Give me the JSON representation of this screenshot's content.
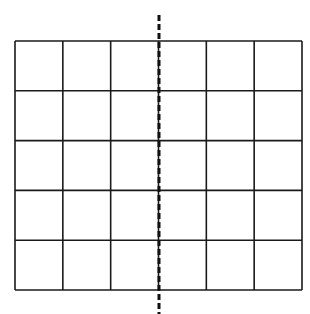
{
  "diagram": {
    "title": "",
    "grid": {
      "rows": 5,
      "cols": 6,
      "left": 15,
      "top": 41,
      "right": 302,
      "bottom": 290,
      "stroke": "#1a1a1a",
      "stroke_width": 1.6
    },
    "symmetry_line": {
      "style": "dashed",
      "x": 159,
      "y1": 15,
      "y2": 314,
      "stroke": "#111111",
      "stroke_width": 3,
      "dash": "6,3"
    }
  }
}
